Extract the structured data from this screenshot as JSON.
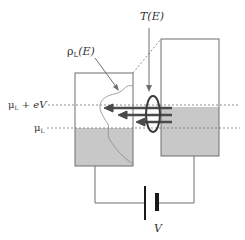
{
  "diagram": {
    "labels": {
      "transmission": "T(E)",
      "dos_symbol": "ρ",
      "dos_sub": "L",
      "dos_arg": "(E)",
      "mu_upper_symbol": "μ",
      "mu_upper_sub": "L",
      "mu_upper_rest": " + eV",
      "mu_lower_symbol": "μ",
      "mu_lower_sub": "L",
      "voltage": "V"
    },
    "colors": {
      "outline": "#6e6e6e",
      "fill": "#c8c8c8",
      "arrow": "#4a4a4a",
      "ellipse": "#3a3a3a",
      "battery": "#1a1a1a"
    },
    "elements": {
      "left_electrode": "box with filled states up to μL and density of states curve",
      "right_electrode": "box with filled states up to μL + eV",
      "tunneling_arrows": 3,
      "battery": "voltage source V"
    }
  }
}
